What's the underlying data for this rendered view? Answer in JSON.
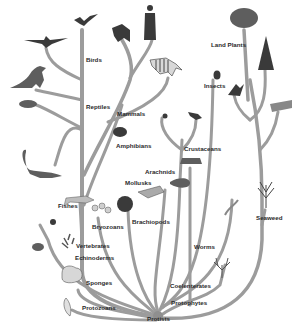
{
  "diagram": {
    "type": "tree-of-life",
    "root": "Protists",
    "labels": {
      "birds": "Birds",
      "reptiles": "Reptiles",
      "mammals": "Mammals",
      "amphibians": "Amphibians",
      "fishes": "Fishes",
      "vertebrates": "Vertebrates",
      "echinoderms": "Echinoderms",
      "sponges": "Sponges",
      "protozoans": "Protozoans",
      "protists": "Protists",
      "bryozoans": "Bryozoans",
      "brachiopods": "Brachiopods",
      "mollusks": "Mollusks",
      "arachnids": "Arachnids",
      "crustaceans": "Crustaceans",
      "insects": "Insects",
      "worms": "Worms",
      "coelenterates": "Coelenterates",
      "protophytes": "Protophytes",
      "land_plants": "Land Plants",
      "seaweed": "Seaweed"
    },
    "illustrations": [
      "eagle",
      "pterosaur",
      "dinosaur",
      "turtle",
      "plesiosaur",
      "chimpanzee",
      "human",
      "zebra",
      "frog",
      "fish",
      "sea-star",
      "sea-urchin",
      "sand-dollar",
      "sponge",
      "protozoan",
      "bryozoan",
      "brachiopod-shell",
      "mollusk",
      "horseshoe-crab",
      "spider",
      "scorpion",
      "crab",
      "beetle",
      "fern",
      "deciduous-tree",
      "conifer",
      "moss",
      "worm",
      "coral",
      "seaweed"
    ]
  }
}
